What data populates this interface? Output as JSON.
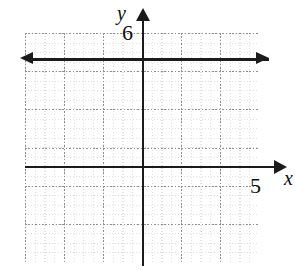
{
  "figure": {
    "type": "coordinate-plane",
    "axis_labels": {
      "x": "x",
      "y": "y"
    },
    "tick_labels": {
      "x_max": "5",
      "y_max": "6"
    }
  },
  "chart_data": {
    "type": "line",
    "title": "",
    "xlabel": "x",
    "ylabel": "y",
    "xlim": [
      -1,
      5
    ],
    "ylim": [
      -2.5,
      6
    ],
    "grid": true,
    "legend": "none",
    "x_tick_labels": [
      "5"
    ],
    "y_tick_labels": [
      "6"
    ],
    "x_major_step": 1,
    "y_major_step": 1,
    "minor_subdivisions": 4,
    "series": [
      {
        "name": "horizontal line",
        "equation": "y = 4",
        "x": [
          -1,
          5
        ],
        "values": [
          4,
          4
        ],
        "arrows": [
          "left",
          "right"
        ],
        "color": "#1b1b1b"
      }
    ]
  }
}
